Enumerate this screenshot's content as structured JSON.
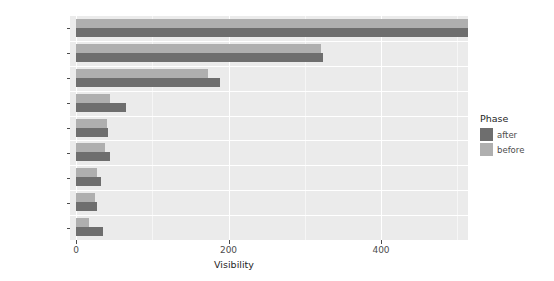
{
  "chart_data": {
    "type": "bar",
    "orientation": "horizontal",
    "title": "",
    "xlabel": "Visibility",
    "ylabel": "",
    "xlim": [
      0,
      522
    ],
    "xticks": [
      0,
      200,
      400
    ],
    "xticklabels": [
      "0",
      "200",
      "400"
    ],
    "grid": true,
    "grid_axis": "x",
    "legend_position": "right",
    "legend_title": "Phase",
    "categories": [
      "other",
      "search",
      "martech",
      "publisher",
      "consulting",
      "reviews",
      "education",
      "reference",
      "social_media"
    ],
    "series": [
      {
        "name": "after",
        "color": "#6E6E6E",
        "values": [
          523,
          324,
          189,
          65,
          42,
          45,
          33,
          28,
          36
        ]
      },
      {
        "name": "before",
        "color": "#AFAFAF",
        "values": [
          519,
          321,
          173,
          45,
          41,
          38,
          27,
          25,
          17
        ]
      }
    ]
  },
  "axis": {
    "x_title": "Visibility",
    "tick_labels": [
      "0",
      "200",
      "400"
    ],
    "category_labels": [
      "other",
      "search",
      "martech",
      "publisher",
      "consulting",
      "reviews",
      "education",
      "reference",
      "social_media"
    ]
  },
  "legend": {
    "title": "Phase",
    "items": [
      {
        "label": "after",
        "color": "#6E6E6E"
      },
      {
        "label": "before",
        "color": "#AFAFAF"
      }
    ]
  },
  "theme": {
    "panel_background": "#EBEBEB",
    "grid_color": "#FFFFFF",
    "text_color": "#4D4D4D",
    "page_background": "#FFFFFF"
  },
  "top_strip_text": ""
}
